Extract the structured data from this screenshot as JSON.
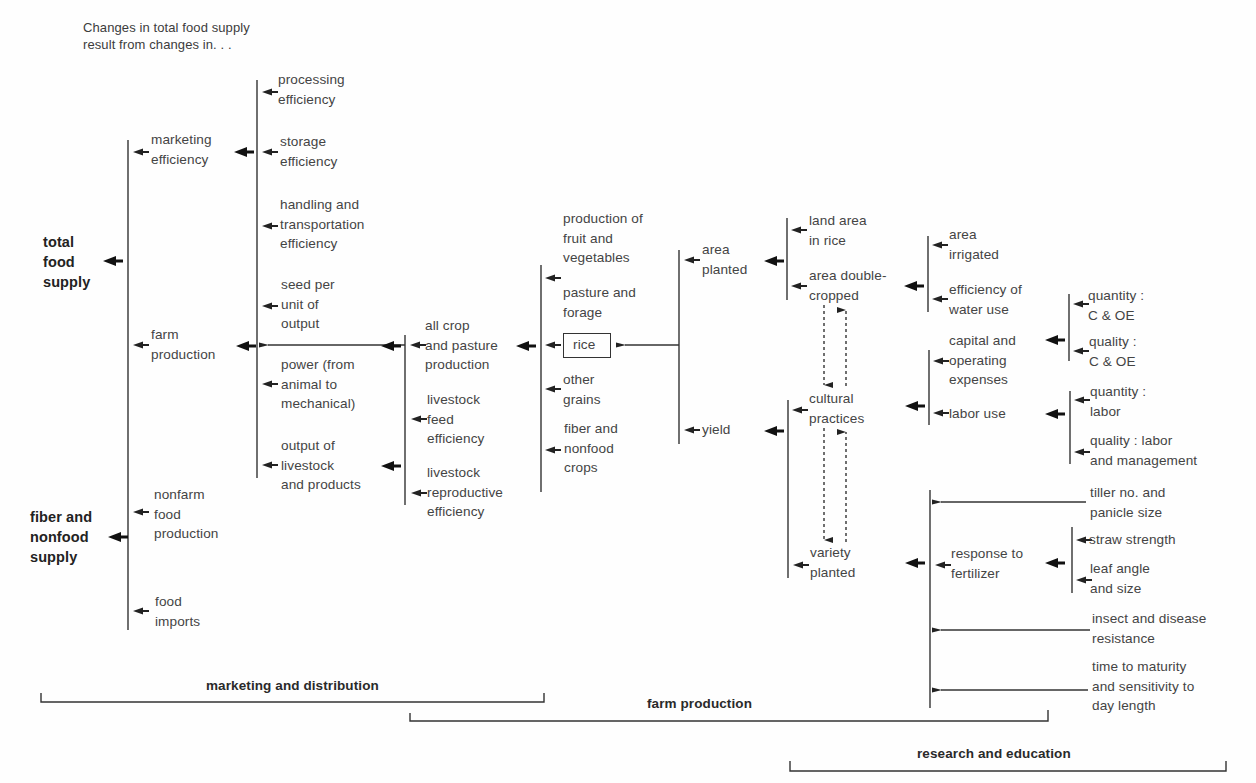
{
  "caption": "Changes in total food supply\nresult from changes in. . .",
  "colors": {
    "ink": "#333333",
    "text": "#444444",
    "background": "#fefefe"
  },
  "nodes": {
    "total_food_supply": "total\nfood\nsupply",
    "fiber_nonfood_supply": "fiber and\nnonfood\nsupply",
    "marketing_efficiency": "marketing\nefficiency",
    "farm_production": "farm\nproduction",
    "nonfarm_food_production": "nonfarm\nfood\nproduction",
    "food_imports": "food\nimports",
    "processing_efficiency": "processing\nefficiency",
    "storage_efficiency": "storage\nefficiency",
    "handling_transport": "handling and\ntransportation\nefficiency",
    "seed_per_unit": "seed per\nunit of\noutput",
    "power": "power (from\nanimal to\nmechanical)",
    "output_livestock": "output of\nlivestock\nand products",
    "all_crop_pasture": "all crop\nand pasture\nproduction",
    "livestock_feed": "livestock\nfeed\nefficiency",
    "livestock_repro": "livestock\nreproductive\nefficiency",
    "fruit_veg": "production of\nfruit and\nvegetables",
    "pasture_forage": "pasture and\nforage",
    "rice": "rice",
    "other_grains": "other\ngrains",
    "fiber_nonfood_crops": "fiber and\nnonfood\ncrops",
    "area_planted": "area\nplanted",
    "yield": "yield",
    "land_area_rice": "land area\nin rice",
    "area_double_cropped": "area double-\ncropped",
    "cultural_practices": "cultural\npractices",
    "variety_planted": "variety\nplanted",
    "area_irrigated": "area\nirrigated",
    "water_use_efficiency": "efficiency of\nwater use",
    "capital_operating": "capital and\noperating\nexpenses",
    "labor_use": "labor use",
    "quantity_coe": "quantity :\nC & OE",
    "quality_coe": "quality :\nC & OE",
    "quantity_labor": "quantity :\nlabor",
    "quality_labor": "quality : labor\nand management",
    "response_fertilizer": "response to\nfertilizer",
    "tiller_panicle": "tiller no. and\npanicle size",
    "straw_strength": "straw strength",
    "leaf_angle": "leaf angle\nand size",
    "insect_disease": "insect and disease\nresistance",
    "time_maturity": "time to maturity\nand sensitivity to\nday length"
  },
  "brackets": {
    "marketing_distribution": "marketing and distribution",
    "farm_production": "farm production",
    "research_education": "research and education"
  }
}
